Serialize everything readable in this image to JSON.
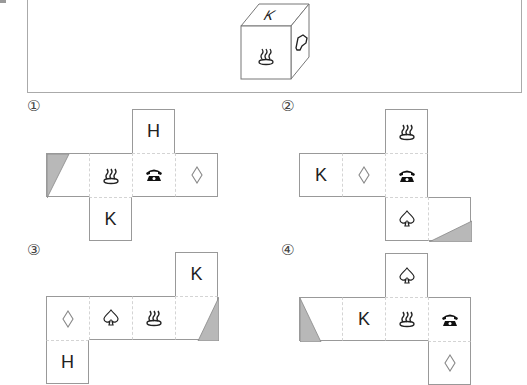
{
  "problem": {
    "reference_cube": {
      "front_face": "hot-spring",
      "top_face": "K",
      "right_face": "pointing-hand"
    }
  },
  "options": [
    {
      "label": "①",
      "cells": [
        {
          "row": 0,
          "col": 2,
          "symbol": "H",
          "type": "letter"
        },
        {
          "row": 1,
          "col": 0,
          "symbol": "",
          "type": "shaded-triangle-left"
        },
        {
          "row": 1,
          "col": 1,
          "symbol": "♨",
          "type": "icon",
          "icon": "hot-spring-icon"
        },
        {
          "row": 1,
          "col": 2,
          "symbol": "☎",
          "type": "icon",
          "icon": "telephone-icon"
        },
        {
          "row": 1,
          "col": 3,
          "symbol": "◇",
          "type": "icon",
          "icon": "diamond-icon"
        },
        {
          "row": 2,
          "col": 1,
          "symbol": "K",
          "type": "letter"
        }
      ]
    },
    {
      "label": "②",
      "cells": [
        {
          "row": 0,
          "col": 2,
          "symbol": "♨",
          "type": "icon",
          "icon": "hot-spring-icon"
        },
        {
          "row": 1,
          "col": 0,
          "symbol": "K",
          "type": "letter"
        },
        {
          "row": 1,
          "col": 1,
          "symbol": "◇",
          "type": "icon",
          "icon": "diamond-icon"
        },
        {
          "row": 1,
          "col": 2,
          "symbol": "☎",
          "type": "icon",
          "icon": "telephone-icon"
        },
        {
          "row": 2,
          "col": 2,
          "symbol": "♤",
          "type": "icon",
          "icon": "spade-icon"
        },
        {
          "row": 2,
          "col": 3,
          "symbol": "",
          "type": "shaded-triangle-bottom-right"
        }
      ]
    },
    {
      "label": "③",
      "cells": [
        {
          "row": 0,
          "col": 3,
          "symbol": "K",
          "type": "letter"
        },
        {
          "row": 1,
          "col": 0,
          "symbol": "◇",
          "type": "icon",
          "icon": "diamond-icon"
        },
        {
          "row": 1,
          "col": 1,
          "symbol": "♤",
          "type": "icon",
          "icon": "spade-icon"
        },
        {
          "row": 1,
          "col": 2,
          "symbol": "♨",
          "type": "icon",
          "icon": "hot-spring-icon"
        },
        {
          "row": 1,
          "col": 3,
          "symbol": "",
          "type": "shaded-triangle-right"
        },
        {
          "row": 2,
          "col": 0,
          "symbol": "H",
          "type": "letter"
        }
      ]
    },
    {
      "label": "④",
      "cells": [
        {
          "row": 0,
          "col": 2,
          "symbol": "♤",
          "type": "icon",
          "icon": "spade-icon"
        },
        {
          "row": 1,
          "col": 0,
          "symbol": "",
          "type": "shaded-triangle-left"
        },
        {
          "row": 1,
          "col": 1,
          "symbol": "K",
          "type": "letter"
        },
        {
          "row": 1,
          "col": 2,
          "symbol": "♨",
          "type": "icon",
          "icon": "hot-spring-icon"
        },
        {
          "row": 1,
          "col": 3,
          "symbol": "☎",
          "type": "icon",
          "icon": "telephone-icon"
        },
        {
          "row": 2,
          "col": 3,
          "symbol": "◇",
          "type": "icon",
          "icon": "diamond-icon"
        }
      ]
    }
  ],
  "cube_top_letter": "K",
  "colors": {
    "line": "#999999",
    "shade": "#b8b8b8",
    "dashed": "#cccccc"
  }
}
